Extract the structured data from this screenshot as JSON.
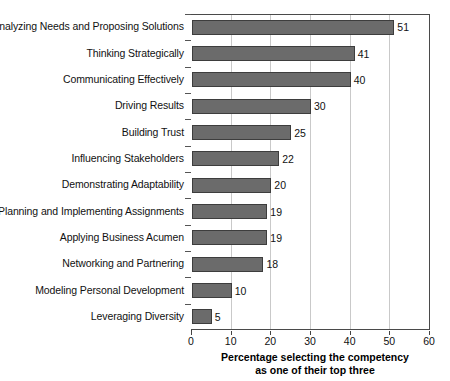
{
  "chart_data": {
    "type": "bar",
    "orientation": "horizontal",
    "title": "",
    "subtitle": "",
    "xlabel": "Percentage selecting the competency as one of their top three",
    "ylabel": "",
    "xlim": [
      0,
      60
    ],
    "xticks": [
      0,
      10,
      20,
      30,
      40,
      50,
      60
    ],
    "grid": "vertical",
    "legend": "none",
    "bar_color": "#6b6b6b",
    "bar_edge_color": "#3d3d3d",
    "categories": [
      "Analyzing Needs and Proposing Solutions",
      "Thinking Strategically",
      "Communicating Effectively",
      "Driving Results",
      "Building Trust",
      "Influencing Stakeholders",
      "Demonstrating Adaptability",
      "Planning and Implementing Assignments",
      "Applying Business Acumen",
      "Networking and Partnering",
      "Modeling Personal Development",
      "Leveraging Diversity"
    ],
    "values": [
      51,
      41,
      40,
      30,
      25,
      22,
      20,
      19,
      19,
      18,
      10,
      5
    ],
    "data_labels": [
      "51",
      "41",
      "40",
      "30",
      "25",
      "22",
      "20",
      "19",
      "19",
      "18",
      "10",
      "5"
    ]
  },
  "axis": {
    "x_tick_labels": [
      "0",
      "10",
      "20",
      "30",
      "40",
      "50",
      "60"
    ],
    "caption_line1": "Percentage selecting the competency",
    "caption_line2": "as one of their top three"
  }
}
